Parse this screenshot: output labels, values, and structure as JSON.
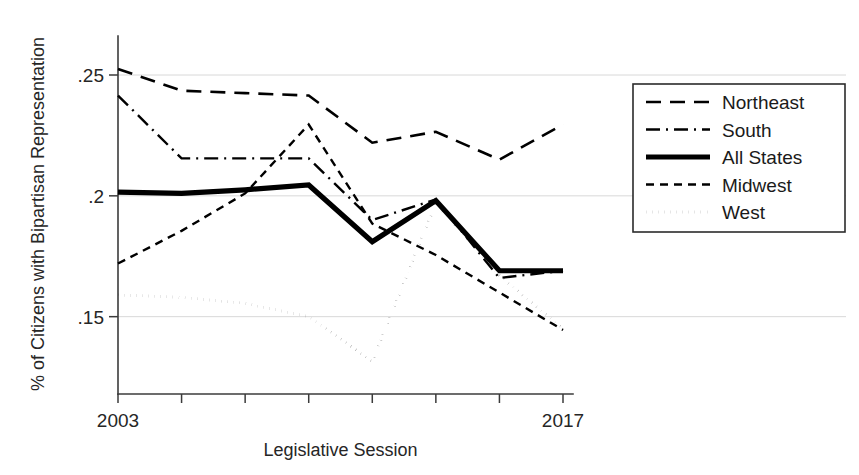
{
  "chart_data": {
    "type": "line",
    "title": "",
    "xlabel": "Legislative Session",
    "ylabel": "% of Citizens with Bipartisan Representation",
    "x": [
      2003,
      2005,
      2007,
      2009,
      2011,
      2013,
      2015,
      2017
    ],
    "xtick_labels": [
      "2003",
      "",
      "",
      "",
      "",
      "",
      "",
      "2017"
    ],
    "ytick_values": [
      0.25,
      0.2,
      0.15
    ],
    "ytick_labels": [
      ".25",
      ".2",
      ".15"
    ],
    "xlim": [
      2003,
      2017
    ],
    "ylim": [
      0.118,
      0.262
    ],
    "grid": "horizontal",
    "legend_position": "right",
    "series": [
      {
        "name": "Northeast",
        "dash": "long-dash",
        "width": 2.6,
        "values": [
          0.2525,
          0.2435,
          0.2425,
          0.2415,
          0.222,
          0.2265,
          0.215,
          0.2295
        ]
      },
      {
        "name": "South",
        "dash": "dash-dot",
        "width": 2.4,
        "values": [
          0.2415,
          0.2155,
          0.2155,
          0.2155,
          0.19,
          0.1985,
          0.166,
          0.169
        ]
      },
      {
        "name": "All States",
        "dash": "solid",
        "width": 5.2,
        "values": [
          0.2015,
          0.201,
          0.2025,
          0.2045,
          0.181,
          0.198,
          0.169,
          0.169
        ]
      },
      {
        "name": "Midwest",
        "dash": "short-dash",
        "width": 2.4,
        "values": [
          0.172,
          0.1855,
          0.201,
          0.2295,
          0.1885,
          0.1755,
          0.16,
          0.1445
        ]
      },
      {
        "name": "West",
        "dash": "dotted",
        "width": 3.0,
        "values": [
          0.159,
          0.158,
          0.1555,
          0.15,
          0.1315,
          0.197,
          0.167,
          0.145
        ]
      }
    ]
  },
  "legend": {
    "items": [
      {
        "label": "Northeast"
      },
      {
        "label": "South"
      },
      {
        "label": "All States"
      },
      {
        "label": "Midwest"
      },
      {
        "label": "West"
      }
    ]
  }
}
